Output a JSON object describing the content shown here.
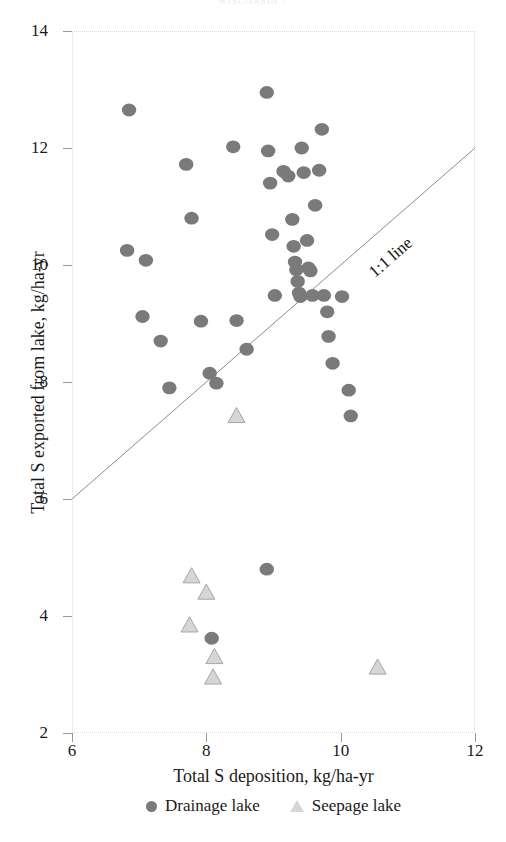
{
  "figure": {
    "running_head": "WISCONSIN 7",
    "annotation_label": "1:1 line"
  },
  "chart_data": {
    "type": "scatter",
    "title": "",
    "xlabel": "Total S deposition, kg/ha-yr",
    "ylabel": "Total S  exported from lake, kg/ha-yr",
    "xlim": [
      6,
      12
    ],
    "ylim": [
      2,
      14
    ],
    "xticks": [
      6,
      8,
      10,
      12
    ],
    "yticks": [
      2,
      4,
      6,
      8,
      10,
      12,
      14
    ],
    "grid": false,
    "legend_position": "below-axis",
    "annotations": [
      {
        "text": "1:1 line",
        "type": "reference-line-label",
        "rotation_deg": -30
      }
    ],
    "reference_line": {
      "name": "1:1 line",
      "slope": 1,
      "intercept": 0,
      "from": [
        6,
        6
      ],
      "to": [
        12,
        12
      ]
    },
    "series": [
      {
        "name": "Drainage lake",
        "marker": "circle",
        "color": "#7a7a7a",
        "points": [
          [
            6.85,
            12.65
          ],
          [
            6.82,
            10.25
          ],
          [
            7.1,
            10.08
          ],
          [
            7.05,
            9.12
          ],
          [
            7.32,
            8.7
          ],
          [
            7.45,
            7.9
          ],
          [
            7.7,
            11.72
          ],
          [
            7.78,
            10.8
          ],
          [
            7.92,
            9.04
          ],
          [
            8.05,
            8.15
          ],
          [
            8.15,
            7.98
          ],
          [
            8.4,
            12.02
          ],
          [
            8.45,
            9.05
          ],
          [
            8.6,
            8.56
          ],
          [
            8.9,
            12.95
          ],
          [
            8.92,
            11.95
          ],
          [
            8.95,
            11.4
          ],
          [
            8.98,
            10.52
          ],
          [
            9.02,
            9.48
          ],
          [
            9.15,
            11.6
          ],
          [
            9.22,
            11.52
          ],
          [
            9.28,
            10.78
          ],
          [
            9.3,
            10.32
          ],
          [
            9.32,
            10.05
          ],
          [
            9.34,
            9.92
          ],
          [
            9.36,
            9.72
          ],
          [
            9.38,
            9.52
          ],
          [
            9.4,
            9.46
          ],
          [
            9.42,
            12.0
          ],
          [
            9.45,
            11.58
          ],
          [
            9.5,
            10.42
          ],
          [
            9.52,
            9.95
          ],
          [
            9.55,
            9.9
          ],
          [
            9.58,
            9.48
          ],
          [
            9.62,
            11.02
          ],
          [
            9.68,
            11.62
          ],
          [
            9.72,
            12.32
          ],
          [
            9.75,
            9.48
          ],
          [
            9.8,
            9.2
          ],
          [
            9.82,
            8.78
          ],
          [
            9.88,
            8.32
          ],
          [
            10.02,
            9.46
          ],
          [
            10.12,
            7.86
          ],
          [
            10.15,
            7.42
          ],
          [
            8.9,
            4.8
          ],
          [
            8.08,
            3.62
          ]
        ]
      },
      {
        "name": "Seepage lake",
        "marker": "triangle",
        "color": "#d6d6d6",
        "points": [
          [
            8.45,
            7.42
          ],
          [
            7.78,
            4.68
          ],
          [
            8.0,
            4.4
          ],
          [
            7.75,
            3.84
          ],
          [
            8.12,
            3.3
          ],
          [
            8.1,
            2.95
          ],
          [
            10.55,
            3.12
          ]
        ]
      }
    ]
  }
}
